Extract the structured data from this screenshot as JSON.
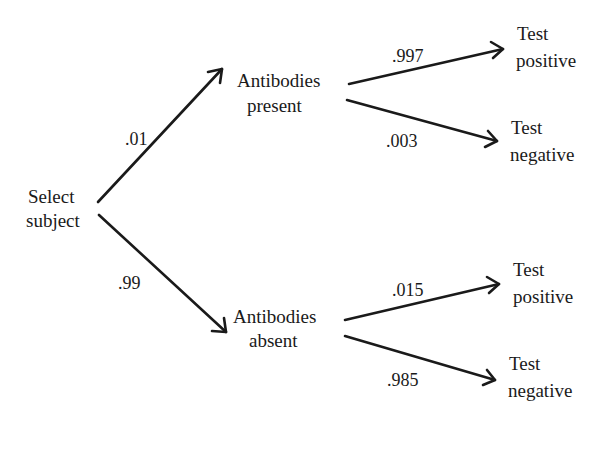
{
  "diagram": {
    "type": "probability-tree",
    "root": {
      "label_line1": "Select",
      "label_line2": "subject"
    },
    "level1": [
      {
        "label_line1": "Antibodies",
        "label_line2": "present",
        "probability": ".01",
        "children": [
          {
            "label_line1": "Test",
            "label_line2": "positive",
            "probability": ".997"
          },
          {
            "label_line1": "Test",
            "label_line2": "negative",
            "probability": ".003"
          }
        ]
      },
      {
        "label_line1": "Antibodies",
        "label_line2": "absent",
        "probability": ".99",
        "children": [
          {
            "label_line1": "Test",
            "label_line2": "positive",
            "probability": ".015"
          },
          {
            "label_line1": "Test",
            "label_line2": "negative",
            "probability": ".985"
          }
        ]
      }
    ],
    "colors": {
      "ink": "#1a1a1a",
      "background": "#ffffff"
    }
  }
}
